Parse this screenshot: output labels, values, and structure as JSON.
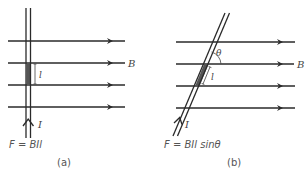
{
  "figure": {
    "panels": [
      {
        "id": "a",
        "caption": "(a)",
        "formula": "F = BIl",
        "field_label": "B",
        "current_label": "I",
        "length_label": "l",
        "wire_orientation": "perpendicular to field"
      },
      {
        "id": "b",
        "caption": "(b)",
        "formula": "F = BIl sinθ",
        "field_label": "B",
        "current_label": "I",
        "length_label": "l",
        "angle_label": "θ",
        "wire_orientation": "at angle θ to field"
      }
    ],
    "colors": {
      "line": "#2a2a2a",
      "shade": "#555555",
      "text": "#555555",
      "background": "#ffffff"
    }
  }
}
